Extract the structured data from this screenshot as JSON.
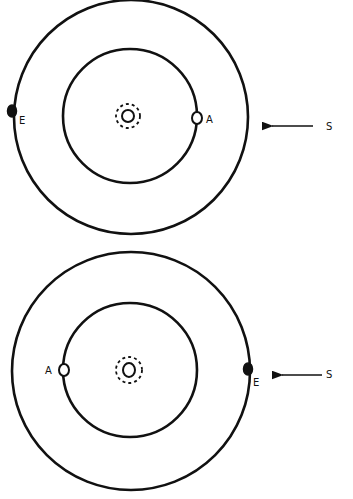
{
  "figure": {
    "panels": [
      {
        "id": "top",
        "center": [
          131,
          117
        ],
        "outer_radius": 117,
        "inner_radius": 67,
        "planet_a": {
          "label": "A",
          "position": "right",
          "xy": [
            197,
            118
          ],
          "fill": "open"
        },
        "planet_e": {
          "label": "E",
          "position": "left",
          "xy": [
            13,
            113
          ],
          "fill": "solid"
        },
        "sun_arrow": {
          "label": "S",
          "from": [
            313,
            126
          ],
          "to": [
            266,
            126
          ]
        }
      },
      {
        "id": "bottom",
        "center": [
          131,
          371
        ],
        "outer_radius": 119,
        "inner_radius": 67,
        "planet_a": {
          "label": "A",
          "position": "left",
          "xy": [
            63,
            369
          ],
          "fill": "open"
        },
        "planet_e": {
          "label": "E",
          "position": "right",
          "xy": [
            249,
            369
          ],
          "fill": "solid"
        },
        "sun_arrow": {
          "label": "S",
          "from": [
            322,
            375
          ],
          "to": [
            276,
            375
          ]
        }
      }
    ],
    "colors": {
      "stroke": "#111111",
      "background": "#ffffff"
    }
  }
}
